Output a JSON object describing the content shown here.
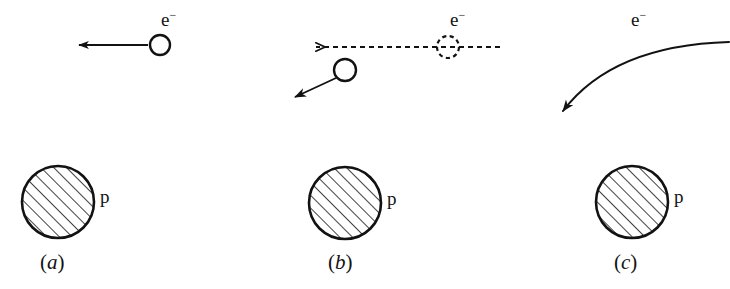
{
  "figure": {
    "background_color": "#ffffff",
    "ink_color": "#121212"
  },
  "panels": [
    {
      "id": "a",
      "caption_open": "(",
      "caption_letter": "a",
      "caption_close": ")",
      "electron_label": "e",
      "electron_charge": "−",
      "proton_label": "p",
      "description": "incoming electron moving left, undeflected",
      "electron_circle": {
        "cx": 160,
        "cy": 45,
        "r": 10,
        "style": "solid"
      },
      "velocity_arrow": {
        "x1": 148,
        "y1": 45,
        "x2": 76,
        "y2": 45,
        "style": "solid",
        "head": "filled"
      },
      "proton_circle": {
        "cx": 58,
        "cy": 202,
        "r": 36
      }
    },
    {
      "id": "b",
      "caption_open": "(",
      "caption_letter": "b",
      "caption_close": ")",
      "electron_label": "e",
      "electron_charge": "−",
      "proton_label": "p",
      "description": "original straight path shown dashed; deflected electron shown solid",
      "ghost_electron_circle": {
        "cx": 448,
        "cy": 47,
        "r": 11,
        "style": "dashed"
      },
      "ghost_path_arrow": {
        "x1": 500,
        "y1": 47,
        "x2": 312,
        "y2": 47,
        "style": "dashed",
        "head": "open"
      },
      "electron_circle": {
        "cx": 345,
        "cy": 70,
        "r": 11,
        "style": "solid"
      },
      "velocity_arrow": {
        "x1": 337,
        "y1": 78,
        "x2": 292,
        "y2": 99,
        "style": "solid",
        "head": "filled"
      },
      "proton_circle": {
        "cx": 345,
        "cy": 203,
        "r": 36
      }
    },
    {
      "id": "c",
      "caption_open": "(",
      "caption_letter": "c",
      "caption_close": ")",
      "electron_label": "e",
      "electron_charge": "−",
      "proton_label": "p",
      "description": "continuously curving electron trajectory bending toward the proton",
      "curve": {
        "x1": 729,
        "y1": 42,
        "cx": 610,
        "cy": 58,
        "x2": 559,
        "y2": 117,
        "style": "solid",
        "head": "filled"
      },
      "proton_circle": {
        "cx": 632,
        "cy": 202,
        "r": 36
      }
    }
  ],
  "labels": {
    "electron_a": {
      "text": "e",
      "sup": "−",
      "x": 161,
      "y": 10
    },
    "electron_b": {
      "text": "e",
      "sup": "−",
      "x": 450,
      "y": 10
    },
    "electron_c": {
      "text": "e",
      "sup": "−",
      "x": 631,
      "y": 10
    },
    "proton_a": {
      "text": "p",
      "x": 100,
      "y": 186
    },
    "proton_b": {
      "text": "p",
      "x": 387,
      "y": 188
    },
    "proton_c": {
      "text": "p",
      "x": 674,
      "y": 186
    },
    "caption_a": {
      "x": 40,
      "y": 253
    },
    "caption_b": {
      "x": 328,
      "y": 253
    },
    "caption_c": {
      "x": 614,
      "y": 253
    }
  },
  "hatching": {
    "angle_deg": 45,
    "spacing_px": 9,
    "line_width_px": 1.6,
    "direction": "lower-left to upper-right"
  }
}
